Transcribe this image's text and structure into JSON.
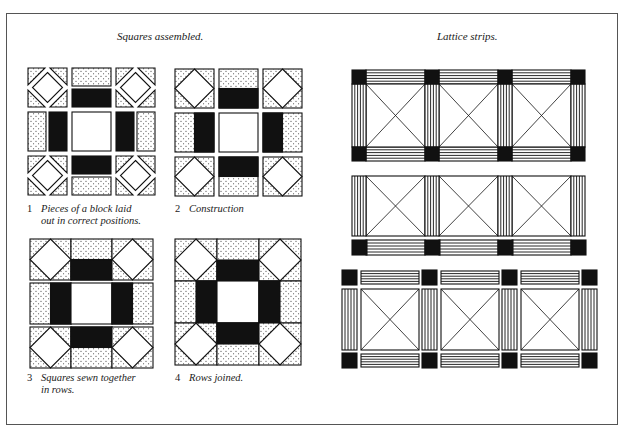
{
  "headings": {
    "left": "Squares assembled.",
    "right": "Lattice strips."
  },
  "captions": [
    {
      "num": "1",
      "text": "Pieces of a block laid\nout in correct positions."
    },
    {
      "num": "2",
      "text": "Construction"
    },
    {
      "num": "3",
      "text": "Squares sewn together\nin rows."
    },
    {
      "num": "4",
      "text": "Rows joined."
    }
  ],
  "colors": {
    "ink": "#111111",
    "paper": "#ffffff",
    "frame": "#555555"
  },
  "figures": {
    "step1": {
      "x": 28,
      "y": 68,
      "cell": 39,
      "gap": 5,
      "separated_pieces": true
    },
    "step2": {
      "x": 175,
      "y": 69,
      "cell": 39,
      "gap": 5
    },
    "step3": {
      "x": 30,
      "y": 239,
      "cell": 41,
      "row_gap": 3
    },
    "step4": {
      "x": 175,
      "y": 239,
      "cell": 42
    }
  },
  "lattice": [
    {
      "style": "joined-top-bottom",
      "x": 352,
      "y": 70,
      "pitch": 73,
      "sq": 14,
      "panel_h": 63,
      "lines": 5
    },
    {
      "style": "panel-plus-bottom-strip",
      "x": 352,
      "y": 176,
      "pitch": 73,
      "sq": 14,
      "panel_h": 60,
      "lines": 5
    },
    {
      "style": "all-separated",
      "x": 342,
      "y": 270,
      "pitch": 80,
      "sq": 15,
      "panel_h": 61,
      "lines": 5
    }
  ]
}
